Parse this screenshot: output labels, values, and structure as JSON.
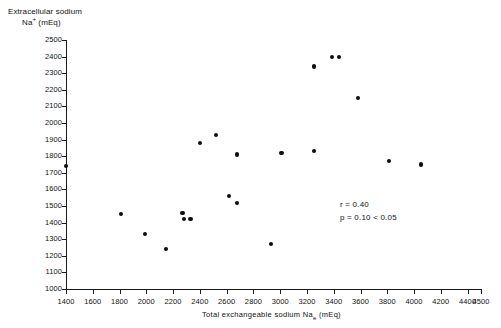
{
  "chart_data": {
    "type": "scatter",
    "title": "",
    "xlabel": "Total exchangeable sodium Nae (mEq)",
    "xlabel_main": "Total exchangeable sodium Na",
    "xlabel_sub": "e",
    "xlabel_units": " (mEq)",
    "ylabel": "Extracellular sodium Na+ (mEq)",
    "ylabel_line1": "Extracellular sodium",
    "ylabel_line2_main": "Na",
    "ylabel_line2_sup": "+",
    "ylabel_line2_units": " (mEq)",
    "xlim": [
      1400,
      4500
    ],
    "ylim": [
      1000,
      2500
    ],
    "grid": false,
    "legend": "none",
    "xticks": [
      1400,
      1600,
      1800,
      2000,
      2200,
      2400,
      2600,
      2800,
      3000,
      3200,
      3400,
      3600,
      3800,
      4000,
      4200,
      4400,
      4500
    ],
    "yticks": [
      1000,
      1100,
      1200,
      1300,
      1400,
      1500,
      1600,
      1700,
      1800,
      1900,
      2000,
      2100,
      2200,
      2300,
      2400,
      2500
    ],
    "points": [
      {
        "x": 1400,
        "y": 1740
      },
      {
        "x": 1810,
        "y": 1450
      },
      {
        "x": 1990,
        "y": 1330
      },
      {
        "x": 2150,
        "y": 1240
      },
      {
        "x": 2270,
        "y": 1460
      },
      {
        "x": 2330,
        "y": 1420
      },
      {
        "x": 2280,
        "y": 1420
      },
      {
        "x": 2400,
        "y": 1880
      },
      {
        "x": 2520,
        "y": 1930
      },
      {
        "x": 2620,
        "y": 1560
      },
      {
        "x": 2680,
        "y": 1520
      },
      {
        "x": 2680,
        "y": 1810
      },
      {
        "x": 2930,
        "y": 1270
      },
      {
        "x": 3010,
        "y": 1820
      },
      {
        "x": 3250,
        "y": 1830
      },
      {
        "x": 3250,
        "y": 2340
      },
      {
        "x": 3390,
        "y": 2400
      },
      {
        "x": 3440,
        "y": 2400
      },
      {
        "x": 3580,
        "y": 2150
      },
      {
        "x": 3810,
        "y": 1770
      },
      {
        "x": 4050,
        "y": 1750
      }
    ],
    "annotations": {
      "r_value": "r = 0.40",
      "p_value": "p = 0.10 < 0.05"
    }
  }
}
